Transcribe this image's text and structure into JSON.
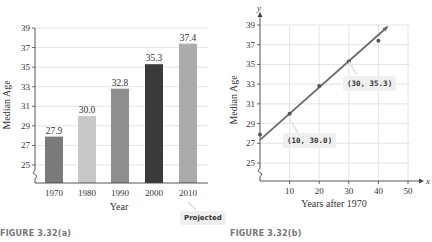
{
  "chart_data": [
    {
      "type": "bar",
      "title": "",
      "figure_label": "FIGURE 3.32(a)",
      "xlabel": "Year",
      "ylabel": "Median Age",
      "categories": [
        "1970",
        "1980",
        "1990",
        "2000",
        "2010"
      ],
      "values": [
        27.9,
        30.0,
        32.8,
        35.3,
        37.4
      ],
      "value_labels": [
        "27.9",
        "30.0",
        "32.8",
        "35.3",
        "37.4"
      ],
      "bar_colors": [
        "#7a7a7a",
        "#c8c8c8",
        "#8e8e8e",
        "#3a3a3a",
        "#ababab"
      ],
      "yticks": [
        "25",
        "27",
        "29",
        "31",
        "33",
        "35",
        "37",
        "39"
      ],
      "ylim": [
        23.2,
        39
      ],
      "axis_break": true,
      "grid": "horizontal",
      "annotation": "Projected",
      "annotation_target": "2010"
    },
    {
      "type": "scatter",
      "title": "",
      "figure_label": "FIGURE 3.32(b)",
      "xlabel": "Years after 1970",
      "ylabel": "Median Age",
      "x_axis_letter": "x",
      "y_axis_letter": "y",
      "points": [
        {
          "x": 0,
          "y": 27.9
        },
        {
          "x": 10,
          "y": 30.0
        },
        {
          "x": 20,
          "y": 32.8
        },
        {
          "x": 30,
          "y": 35.3
        },
        {
          "x": 40,
          "y": 37.4
        }
      ],
      "line": {
        "from": {
          "x": 0,
          "y": 27.35
        },
        "to": {
          "x": 43,
          "y": 38.8
        },
        "arrow": true
      },
      "xticks": [
        "10",
        "20",
        "30",
        "40",
        "50"
      ],
      "yticks": [
        "25",
        "27",
        "29",
        "31",
        "33",
        "35",
        "37",
        "39"
      ],
      "xlim": [
        0,
        50
      ],
      "ylim": [
        23.2,
        39
      ],
      "axis_break": true,
      "grid": "both",
      "annotations": [
        "(10, 30.0)",
        "(30, 35.3)"
      ]
    }
  ]
}
